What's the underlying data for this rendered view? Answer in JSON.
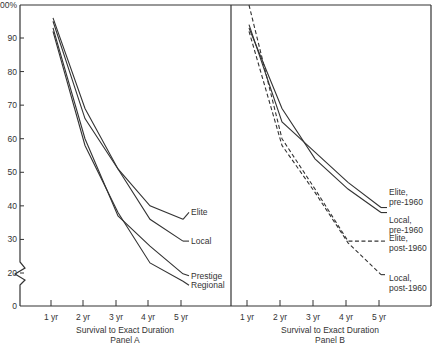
{
  "chart_data": [
    {
      "type": "line",
      "panel": "Panel A",
      "xlabel": "Survival to Exact Duration",
      "subtitle": "Panel A",
      "x": [
        "1 yr",
        "2 yr",
        "3 yr",
        "4 yr",
        "5 yr"
      ],
      "y_ticks": [
        "0",
        "20",
        "30",
        "40",
        "50",
        "60",
        "70",
        "80",
        "90",
        "100%"
      ],
      "ylim": [
        0,
        100
      ],
      "y_axis_break": true,
      "grid": false,
      "series": [
        {
          "name": "Elite",
          "style": "solid",
          "values": [
            96,
            69,
            51,
            40,
            36
          ]
        },
        {
          "name": "Local",
          "style": "solid",
          "values": [
            95,
            66,
            51,
            36,
            29.5
          ]
        },
        {
          "name": "Prestige",
          "style": "solid",
          "values": [
            93,
            60,
            37,
            28,
            19.5
          ]
        },
        {
          "name": "Regional",
          "style": "solid",
          "values": [
            92,
            58,
            38,
            23,
            15
          ]
        }
      ]
    },
    {
      "type": "line",
      "panel": "Panel B",
      "xlabel": "Survival to Exact Duration",
      "subtitle": "Panel B",
      "x": [
        "1 yr",
        "2 yr",
        "3 yr",
        "4 yr",
        "5 yr"
      ],
      "ylim": [
        0,
        100
      ],
      "grid": false,
      "series": [
        {
          "name": "Elite, pre-1960",
          "label_lines": [
            "Elite,",
            "pre-1960"
          ],
          "style": "solid",
          "values": [
            94,
            65,
            56,
            47,
            39.5
          ]
        },
        {
          "name": "Local, pre-1960",
          "label_lines": [
            "Local,",
            "pre-1960"
          ],
          "style": "solid",
          "values": [
            93,
            69,
            54,
            45,
            38
          ]
        },
        {
          "name": "Elite, post-1960",
          "label_lines": [
            "Elite,",
            "post-1960"
          ],
          "style": "dashed",
          "values": [
            100,
            60,
            45,
            29.5,
            29.5
          ]
        },
        {
          "name": "Local, post-1960",
          "label_lines": [
            "Local,",
            "post-1960"
          ],
          "style": "dashed",
          "values": [
            92,
            58,
            44,
            29,
            19
          ]
        }
      ]
    }
  ]
}
